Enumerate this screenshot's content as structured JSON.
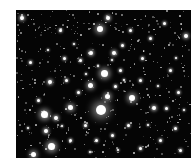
{
  "image": {
    "subject": "star cluster field",
    "background_color": "#050505",
    "star_color": "#ffffff"
  },
  "stars": [
    {
      "x": 101,
      "y": 110,
      "r": 5
    },
    {
      "x": 104,
      "y": 73,
      "r": 3.5
    },
    {
      "x": 90,
      "y": 85,
      "r": 2.5
    },
    {
      "x": 132,
      "y": 98,
      "r": 3
    },
    {
      "x": 44,
      "y": 114,
      "r": 3.5
    },
    {
      "x": 51,
      "y": 146,
      "r": 3.5
    },
    {
      "x": 70,
      "y": 107,
      "r": 2.5
    },
    {
      "x": 100,
      "y": 29,
      "r": 3
    },
    {
      "x": 107,
      "y": 96,
      "r": 2.5
    },
    {
      "x": 91,
      "y": 53,
      "r": 2
    },
    {
      "x": 114,
      "y": 53,
      "r": 2
    },
    {
      "x": 50,
      "y": 82,
      "r": 2
    },
    {
      "x": 56,
      "y": 118,
      "r": 2
    },
    {
      "x": 46,
      "y": 131,
      "r": 2
    },
    {
      "x": 33,
      "y": 154,
      "r": 2.5
    },
    {
      "x": 186,
      "y": 36,
      "r": 2
    },
    {
      "x": 108,
      "y": 18,
      "r": 2
    },
    {
      "x": 164,
      "y": 23,
      "r": 1.5
    },
    {
      "x": 154,
      "y": 108,
      "r": 2
    },
    {
      "x": 166,
      "y": 108,
      "r": 1.5
    },
    {
      "x": 80,
      "y": 60,
      "r": 1.5
    },
    {
      "x": 64,
      "y": 58,
      "r": 1.5
    },
    {
      "x": 120,
      "y": 70,
      "r": 1.5
    },
    {
      "x": 142,
      "y": 58,
      "r": 1.5
    },
    {
      "x": 115,
      "y": 86,
      "r": 1.5
    },
    {
      "x": 78,
      "y": 92,
      "r": 1.5
    },
    {
      "x": 140,
      "y": 80,
      "r": 1.5
    },
    {
      "x": 128,
      "y": 125,
      "r": 1.5
    },
    {
      "x": 85,
      "y": 125,
      "r": 1.5
    },
    {
      "x": 112,
      "y": 135,
      "r": 1.5
    },
    {
      "x": 70,
      "y": 140,
      "r": 1.5
    },
    {
      "x": 160,
      "y": 140,
      "r": 1.5
    },
    {
      "x": 175,
      "y": 128,
      "r": 1.5
    },
    {
      "x": 178,
      "y": 92,
      "r": 1.5
    },
    {
      "x": 170,
      "y": 70,
      "r": 1.5
    },
    {
      "x": 150,
      "y": 38,
      "r": 1.5
    },
    {
      "x": 130,
      "y": 30,
      "r": 1.5
    },
    {
      "x": 60,
      "y": 30,
      "r": 1.5
    },
    {
      "x": 30,
      "y": 62,
      "r": 1.5
    },
    {
      "x": 22,
      "y": 18,
      "r": 2
    },
    {
      "x": 38,
      "y": 100,
      "r": 1.5
    },
    {
      "x": 66,
      "y": 80,
      "r": 1.5
    },
    {
      "x": 96,
      "y": 140,
      "r": 1.5
    },
    {
      "x": 140,
      "y": 148,
      "r": 1.5
    },
    {
      "x": 180,
      "y": 150,
      "r": 1.5
    },
    {
      "x": 122,
      "y": 45,
      "r": 1.5
    },
    {
      "x": 112,
      "y": 60,
      "r": 1.2
    },
    {
      "x": 98,
      "y": 66,
      "r": 1.2
    },
    {
      "x": 86,
      "y": 74,
      "r": 1.2
    },
    {
      "x": 124,
      "y": 80,
      "r": 1.2
    },
    {
      "x": 74,
      "y": 44,
      "r": 1.2
    },
    {
      "x": 48,
      "y": 50,
      "r": 1.2
    },
    {
      "x": 158,
      "y": 86,
      "r": 1.2
    },
    {
      "x": 148,
      "y": 125,
      "r": 1.2
    },
    {
      "x": 28,
      "y": 128,
      "r": 1.2
    },
    {
      "x": 62,
      "y": 126,
      "r": 1.2
    },
    {
      "x": 118,
      "y": 150,
      "r": 1.2
    },
    {
      "x": 90,
      "y": 152,
      "r": 1.2
    },
    {
      "x": 176,
      "y": 58,
      "r": 1.2
    },
    {
      "x": 184,
      "y": 110,
      "r": 1.2
    }
  ]
}
